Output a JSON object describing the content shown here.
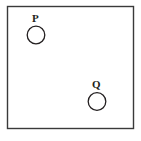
{
  "figure": {
    "type": "geometry-diagram",
    "background_color": "#ffffff",
    "stroke_color": "#231f20",
    "canvas": {
      "width": 141,
      "height": 141
    },
    "border_rectangle": {
      "name": "enclosing-rectangle",
      "x": 7.5,
      "y": 6.5,
      "width": 126,
      "height": 122,
      "stroke_width": 1.4,
      "fill": "none",
      "stroke_color": "#3a3a3a"
    },
    "points": [
      {
        "id": "P",
        "label": "P",
        "circle": {
          "cx": 36,
          "cy": 35,
          "r": 8.8,
          "stroke_width": 1.3,
          "fill": "none"
        },
        "label_position": "above"
      },
      {
        "id": "Q",
        "label": "Q",
        "circle": {
          "cx": 97,
          "cy": 101.5,
          "r": 8.8,
          "stroke_width": 1.3,
          "fill": "none"
        },
        "label_position": "above"
      }
    ]
  }
}
